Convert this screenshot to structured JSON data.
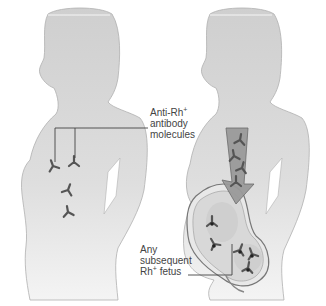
{
  "diagram": {
    "title": "",
    "figures": [
      {
        "id": "left-woman",
        "description": "Rh- woman with anti-Rh+ antibody molecules in her body"
      },
      {
        "id": "right-woman",
        "description": "Pregnant woman; antibodies cross placenta to subsequent Rh+ fetus"
      }
    ],
    "labels": {
      "antibody": {
        "line1": "Anti-Rh",
        "line1_sup": "+",
        "line2": "antibody",
        "line3": "molecules"
      },
      "fetus": {
        "line1": "Any",
        "line2": "subsequent",
        "line3": "Rh",
        "line3_sup": "+",
        "line3_tail": " fetus"
      }
    },
    "colors": {
      "body_fill": "#d4d4d4",
      "body_outline": "#a8a8a8",
      "antibody": "#555555",
      "arrow_fill": "#9a9a9a",
      "womb_fill": "#e6e6e6",
      "leader_line": "#444444"
    }
  }
}
